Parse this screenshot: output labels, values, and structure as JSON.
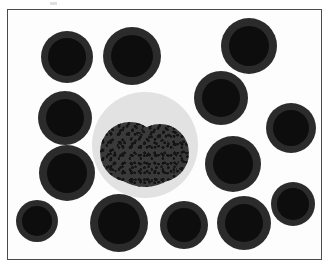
{
  "figure": {
    "kind": "micrograph",
    "caption": "",
    "width": 331,
    "height": 269,
    "background_color": "#ffffff",
    "field_background_color": "#fdfdfd",
    "frame": {
      "color": "#4a4a4a",
      "thickness_px": 1.5,
      "left": 7,
      "top": 9,
      "width": 315,
      "height": 251
    },
    "artifact": {
      "label": "scan-artifact",
      "color": "#d9d9d9",
      "left": 50,
      "top": 2,
      "width": 7,
      "height": 3
    }
  },
  "palette": {
    "cell_rim": "#2b2b2b",
    "cell_core": "#0d0d0d",
    "cytoplasm": "#e2e2e2",
    "nucleus": "#3a3a3a",
    "background": "#fdfdfd",
    "frame": "#4a4a4a"
  },
  "leukocyte": {
    "label": "central-leukocyte",
    "cx": 144,
    "cy": 144,
    "r": 53,
    "cytoplasm_color": "#e2e2e2",
    "nucleus": {
      "label": "bilobed-nucleus",
      "color": "#3a3a3a",
      "lobes": [
        {
          "cx": 129,
          "cy": 151,
          "rx": 30,
          "ry": 30
        },
        {
          "cx": 159,
          "cy": 152,
          "rx": 29,
          "ry": 29
        },
        {
          "cx": 144,
          "cy": 160,
          "rx": 33,
          "ry": 26
        }
      ]
    }
  },
  "erythrocytes": [
    {
      "label": "rbc-top-left",
      "cx": 66,
      "cy": 56,
      "r": 26
    },
    {
      "label": "rbc-top-center",
      "cx": 131,
      "cy": 55,
      "r": 29
    },
    {
      "label": "rbc-top-right",
      "cx": 248,
      "cy": 45,
      "r": 28
    },
    {
      "label": "rbc-upper-right",
      "cx": 220,
      "cy": 97,
      "r": 27
    },
    {
      "label": "rbc-mid-left-upper",
      "cx": 64,
      "cy": 117,
      "r": 27
    },
    {
      "label": "rbc-right-edge",
      "cx": 290,
      "cy": 127,
      "r": 25
    },
    {
      "label": "rbc-mid-left-lower",
      "cx": 66,
      "cy": 172,
      "r": 28
    },
    {
      "label": "rbc-mid-right",
      "cx": 232,
      "cy": 163,
      "r": 28
    },
    {
      "label": "rbc-lower-right-edge",
      "cx": 292,
      "cy": 203,
      "r": 22
    },
    {
      "label": "rbc-bottom-left",
      "cx": 36,
      "cy": 220,
      "r": 21
    },
    {
      "label": "rbc-bottom-center-l",
      "cx": 118,
      "cy": 222,
      "r": 29
    },
    {
      "label": "rbc-bottom-center-r",
      "cx": 183,
      "cy": 224,
      "r": 24
    },
    {
      "label": "rbc-bottom-right",
      "cx": 243,
      "cy": 222,
      "r": 27
    }
  ]
}
